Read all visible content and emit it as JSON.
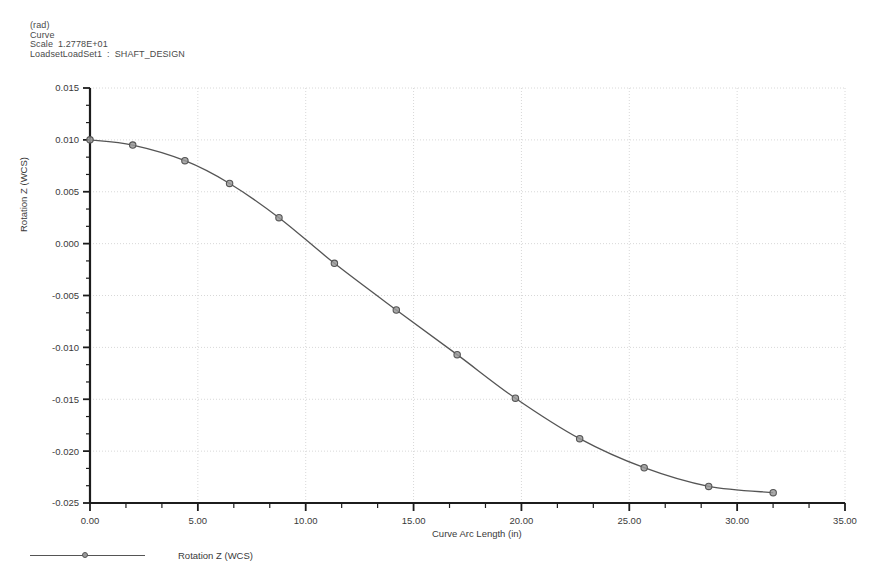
{
  "header": {
    "units": "(rad)",
    "type": "Curve",
    "scale_label": "Scale",
    "scale_value": "1.2778E+01",
    "loadset_label": "LoadsetLoadSet1",
    "loadset_sep": ":",
    "loadset_value": "SHAFT_DESIGN"
  },
  "legend": {
    "entries": [
      {
        "label": "Rotation Z (WCS)",
        "color": "#555555",
        "marker": "circle"
      }
    ]
  },
  "chart_data": {
    "type": "line",
    "title": "",
    "subtitle": "",
    "xlabel": "Curve Arc Length (in)",
    "ylabel": "Rotation Z (WCS)",
    "xlim": [
      0.0,
      35.0
    ],
    "ylim": [
      -0.025,
      0.015
    ],
    "xticks": [
      0.0,
      5.0,
      10.0,
      15.0,
      20.0,
      25.0,
      30.0,
      35.0
    ],
    "xticklabels": [
      "0.00",
      "5.00",
      "10.00",
      "15.00",
      "20.00",
      "25.00",
      "30.00",
      "35.00"
    ],
    "yticks": [
      0.015,
      0.01,
      0.005,
      0.0,
      -0.005,
      -0.01,
      -0.015,
      -0.02,
      -0.025
    ],
    "yticklabels": [
      "0.015",
      "0.010",
      "0.005",
      "0.000",
      "-0.005",
      "-0.010",
      "-0.015",
      "-0.020",
      "-0.025"
    ],
    "minor_ticks_per_interval": 2,
    "grid": true,
    "grid_style": "dotted",
    "grid_color": "#d8d8d8",
    "legend_position": "bottom-left",
    "series": [
      {
        "name": "Rotation Z (WCS)",
        "color": "#555555",
        "marker": "circle",
        "marker_face": "#9a9a9a",
        "x": [
          0.0,
          1.98,
          4.4,
          6.47,
          8.76,
          11.33,
          14.2,
          17.02,
          19.72,
          22.7,
          25.69,
          28.68,
          31.67
        ],
        "y": [
          0.01,
          0.0095,
          0.008,
          0.0058,
          0.0025,
          -0.0019,
          -0.0064,
          -0.0107,
          -0.0149,
          -0.0188,
          -0.0216,
          -0.0234,
          -0.024
        ]
      }
    ]
  }
}
